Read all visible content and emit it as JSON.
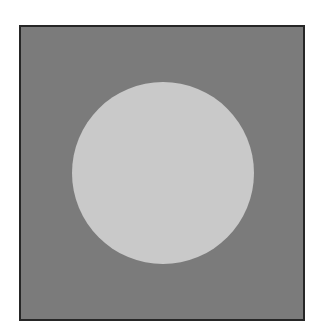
{
  "figure": {
    "background_color": "#ffffff",
    "square": {
      "fill_color": "#7b7b7b",
      "border_color": "#262626"
    },
    "circle": {
      "fill_color": "#c9c9c9",
      "center_x": 163,
      "center_y": 173,
      "diameter": 182
    }
  }
}
